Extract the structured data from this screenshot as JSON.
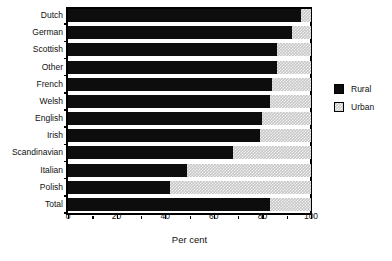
{
  "chart_data": {
    "type": "bar",
    "orientation": "horizontal",
    "stacked": true,
    "title": "",
    "xlabel": "Per cent",
    "ylabel": "",
    "xlim": [
      0,
      100
    ],
    "xticks": [
      0,
      20,
      40,
      60,
      80,
      100
    ],
    "xtick_labels": [
      "0",
      "20",
      "40",
      "60",
      "80",
      "100"
    ],
    "minor_xticks": [
      10,
      30,
      50,
      70,
      90
    ],
    "grid": false,
    "legend_position": "right",
    "categories": [
      "Dutch",
      "German",
      "Scottish",
      "Other",
      "French",
      "Welsh",
      "English",
      "Irish",
      "Scandinavian",
      "Italian",
      "Polish",
      "Total"
    ],
    "series": [
      {
        "name": "Rural",
        "color": "#0d0d0d",
        "values": [
          96,
          92,
          86,
          86,
          84,
          83,
          80,
          79,
          68,
          49,
          42,
          83
        ]
      },
      {
        "name": "Urban",
        "color": "#c6c6c6",
        "values": [
          4,
          8,
          14,
          14,
          16,
          17,
          20,
          21,
          32,
          51,
          58,
          17
        ]
      }
    ]
  },
  "legend": {
    "items": [
      {
        "label": "Rural",
        "swatch": "rural-swatch"
      },
      {
        "label": "Urban",
        "swatch": "urban-swatch"
      }
    ]
  }
}
